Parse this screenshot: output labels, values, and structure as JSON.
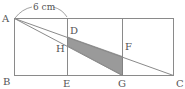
{
  "diagram": {
    "dimension_label": "6 cm",
    "points": {
      "A": "A",
      "B": "B",
      "C": "C",
      "D": "D",
      "E": "E",
      "F": "F",
      "G": "G",
      "H": "H"
    },
    "colors": {
      "line": "#8a8a8a",
      "shade": "#9a9a9a"
    }
  }
}
